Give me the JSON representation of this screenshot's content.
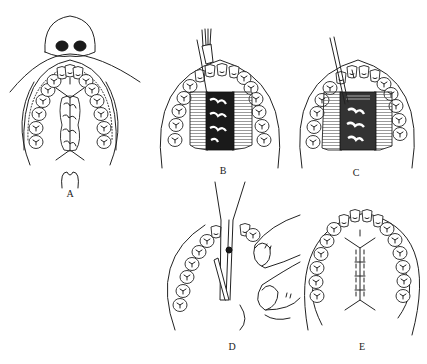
{
  "figure": {
    "header_fragment": "",
    "panels": [
      {
        "id": "A",
        "label": "A",
        "description": "Cleft palate before surgery; outlined incision lines along alveolar margin and cleft edges"
      },
      {
        "id": "B",
        "label": "B",
        "description": "Mucoperiosteal flaps elevated with periosteal elevator"
      },
      {
        "id": "C",
        "label": "C",
        "description": "Flaps further mobilized with elevator toward posterior palate"
      },
      {
        "id": "D",
        "label": "D",
        "description": "Scissors dividing tissue while fingers retract flap"
      },
      {
        "id": "E",
        "label": "E",
        "description": "Flaps sutured along midline after repair"
      }
    ]
  },
  "colors": {
    "background": "#ffffff",
    "ink": "#222222"
  }
}
